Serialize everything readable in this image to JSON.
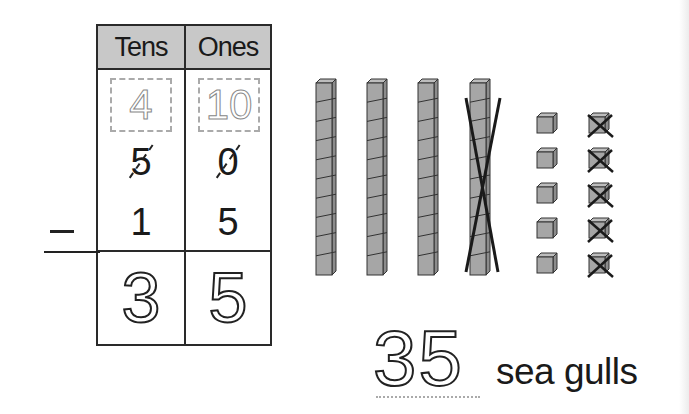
{
  "table": {
    "headers": [
      "Tens",
      "Ones"
    ],
    "regroup": {
      "tens": "4",
      "ones": "10"
    },
    "minuend": {
      "tens": "5",
      "ones": "0"
    },
    "subtrahend": {
      "tens": "1",
      "ones": "5"
    },
    "operator": "−",
    "result": {
      "tens": "3",
      "ones": "5"
    }
  },
  "blocks": {
    "tens_rods": 4,
    "crossed_rods": 1,
    "ones_left": 5,
    "ones_crossed": 5
  },
  "answer": {
    "value": "35",
    "label": "sea gulls"
  }
}
